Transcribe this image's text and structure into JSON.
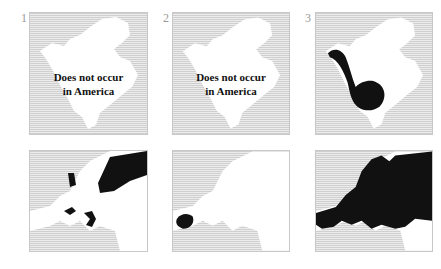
{
  "figure": {
    "panels": [
      {
        "number": "1",
        "region": "North America",
        "caption_line1": "Does not occur",
        "caption_line2": "in America",
        "range": "none"
      },
      {
        "number": "2",
        "region": "North America",
        "caption_line1": "Does not occur",
        "caption_line2": "in America",
        "range": "none"
      },
      {
        "number": "3",
        "region": "North America",
        "range": "western and central interior, from Alaska to Texas"
      },
      {
        "number": "",
        "region": "Europe",
        "range": "northeast Russia, Baltic coast and central Europe patches"
      },
      {
        "number": "",
        "region": "Europe",
        "range": "Iberian Peninsula"
      },
      {
        "number": "",
        "region": "Europe",
        "range": "most of Europe"
      }
    ],
    "colors": {
      "land": "#ffffff",
      "sea": "#dcdcdc",
      "range": "#111111"
    }
  }
}
